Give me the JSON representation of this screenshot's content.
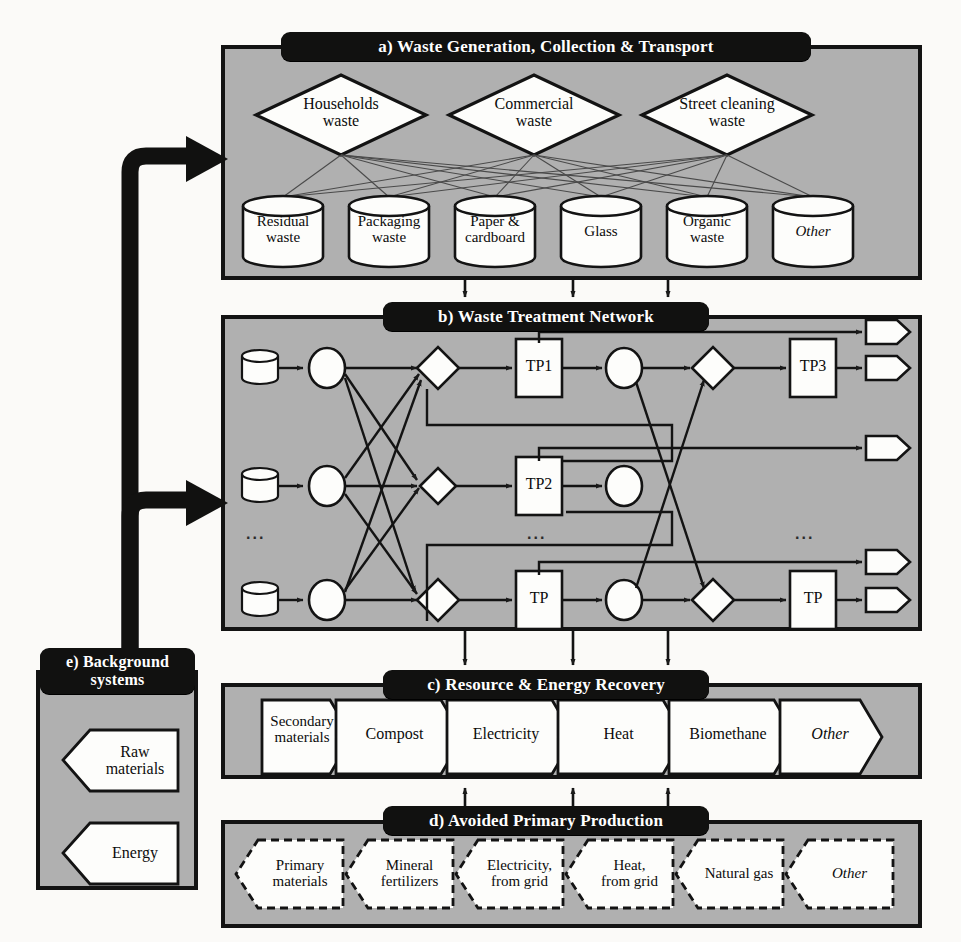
{
  "figure": {
    "background_color": "#fbfaf8",
    "panel_fill": "#b0b0b0",
    "node_fill": "#fdfdfb",
    "ribbon_color": "#111110",
    "line_color": "#1a1a1a"
  },
  "panels": {
    "a": {
      "id": "a",
      "title": "a) Waste Generation, Collection & Transport",
      "sources": [
        {
          "label_line1": "Households",
          "label_line2": "waste"
        },
        {
          "label_line1": "Commercial",
          "label_line2": "waste"
        },
        {
          "label_line1": "Street cleaning",
          "label_line2": "waste"
        }
      ],
      "fractions": [
        {
          "label_line1": "Residual",
          "label_line2": "waste",
          "italic": false
        },
        {
          "label_line1": "Packaging",
          "label_line2": "waste",
          "italic": false
        },
        {
          "label_line1": "Paper &",
          "label_line2": "cardboard",
          "italic": false
        },
        {
          "label_line1": "Glass",
          "label_line2": "",
          "italic": false
        },
        {
          "label_line1": "Organic",
          "label_line2": "waste",
          "italic": false
        },
        {
          "label_line1": "Other",
          "label_line2": "",
          "italic": true
        }
      ]
    },
    "b": {
      "id": "b",
      "title": "b) Waste Treatment Network",
      "treatment_plants_left": [
        "TP1",
        "TP2",
        "TP"
      ],
      "treatment_plants_right": [
        "TP3",
        "TP"
      ],
      "ellipsis": "...",
      "rows": 3
    },
    "c": {
      "id": "c",
      "title": "c) Resource & Energy Recovery",
      "outputs": [
        {
          "label_line1": "Secondary",
          "label_line2": "materials",
          "italic": false
        },
        {
          "label_line1": "Compost",
          "label_line2": "",
          "italic": false
        },
        {
          "label_line1": "Electricity",
          "label_line2": "",
          "italic": false
        },
        {
          "label_line1": "Heat",
          "label_line2": "",
          "italic": false
        },
        {
          "label_line1": "Biomethane",
          "label_line2": "",
          "italic": false
        },
        {
          "label_line1": "Other",
          "label_line2": "",
          "italic": true
        }
      ]
    },
    "d": {
      "id": "d",
      "title": "d) Avoided Primary Production",
      "avoided": [
        {
          "label_line1": "Primary",
          "label_line2": "materials",
          "italic": false
        },
        {
          "label_line1": "Mineral",
          "label_line2": "fertilizers",
          "italic": false
        },
        {
          "label_line1": "Electricity,",
          "label_line2": "from grid",
          "italic": false
        },
        {
          "label_line1": "Heat,",
          "label_line2": "from grid",
          "italic": false
        },
        {
          "label_line1": "Natural gas",
          "label_line2": "",
          "italic": false
        },
        {
          "label_line1": "Other",
          "label_line2": "",
          "italic": true
        }
      ]
    },
    "e": {
      "id": "e",
      "title_line1": "e) Background",
      "title_line2": "systems",
      "title": "e) Background systems",
      "inputs": [
        {
          "label_line1": "Raw",
          "label_line2": "materials"
        },
        {
          "label_line1": "Energy",
          "label_line2": ""
        }
      ]
    }
  }
}
